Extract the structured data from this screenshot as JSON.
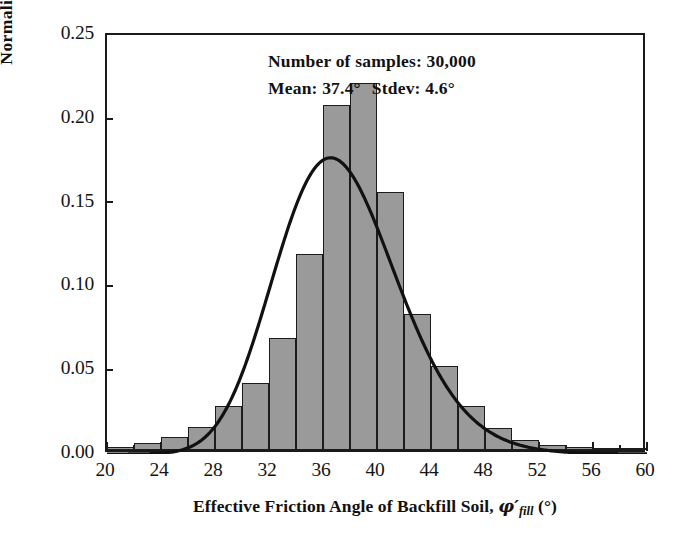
{
  "chart_data": {
    "type": "bar",
    "title": "",
    "subtitle": "",
    "xlabel": "Effective Friction Angle of Backfill Soil, φ'fill (°)",
    "ylabel": "Normalized  Frequency",
    "xlim": [
      20,
      60
    ],
    "ylim": [
      0.0,
      0.25
    ],
    "grid": false,
    "legend": null,
    "x_ticks": [
      "20",
      "24",
      "28",
      "32",
      "36",
      "40",
      "44",
      "48",
      "52",
      "56",
      "60"
    ],
    "x_tick_values": [
      20,
      24,
      28,
      32,
      36,
      40,
      44,
      48,
      52,
      56,
      60
    ],
    "x_minor_tick_values": [
      22,
      26,
      30,
      34,
      38,
      42,
      46,
      50,
      54,
      58
    ],
    "y_ticks": [
      "0.00",
      "0.05",
      "0.10",
      "0.15",
      "0.20",
      "0.25"
    ],
    "y_tick_values": [
      0.0,
      0.05,
      0.1,
      0.15,
      0.2,
      0.25
    ],
    "bin_width": 2,
    "bin_starts": [
      20,
      22,
      24,
      26,
      28,
      30,
      32,
      34,
      36,
      38,
      40,
      42,
      44,
      46,
      48,
      50,
      52,
      54,
      56,
      58
    ],
    "bin_centers": [
      21,
      23,
      25,
      27,
      29,
      31,
      33,
      35,
      37,
      39,
      41,
      43,
      45,
      47,
      49,
      51,
      53,
      55,
      57,
      59
    ],
    "values": [
      0.002,
      0.004,
      0.008,
      0.014,
      0.026,
      0.04,
      0.067,
      0.117,
      0.206,
      0.219,
      0.154,
      0.081,
      0.05,
      0.026,
      0.013,
      0.006,
      0.003,
      0.002,
      0.001,
      0.001
    ],
    "fit_curve": {
      "name": "lognormal fit",
      "mean": 37.4,
      "stdev": 4.6
    }
  },
  "annotation": {
    "line1": "Number of samples: 30,000",
    "line2_left": "Mean: 37.4°",
    "line2_right": "Stdev: 4.6°"
  },
  "axis_titles": {
    "x_main": "Effective Friction Angle of Backfill Soil,",
    "x_symbol": "φ′",
    "x_subscript": "fill",
    "x_unit": "(°)",
    "y": "Normalized  Frequency"
  },
  "colors": {
    "bar_fill": "#9a9a9a",
    "bar_edge": "#1c1c1c",
    "axis": "#1a1a1a",
    "curve": "#111111",
    "text": "#141414",
    "background": "#ffffff"
  }
}
